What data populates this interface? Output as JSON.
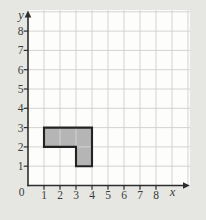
{
  "figure": {
    "background": "#e6e7e2",
    "plot_background": "#fdfdfc",
    "grid_color": "#d3d3d0",
    "axis_color": "#2d2d2d",
    "text_color": "#3b3b3b"
  },
  "chart_data": {
    "type": "polygon",
    "title": "",
    "xlabel": "x",
    "ylabel": "y",
    "origin_label": "0",
    "xlim": [
      0,
      9
    ],
    "ylim": [
      0,
      9
    ],
    "x_ticks": [
      "1",
      "2",
      "3",
      "4",
      "5",
      "6",
      "7",
      "8"
    ],
    "y_ticks": [
      "1",
      "2",
      "3",
      "4",
      "5",
      "6",
      "7",
      "8"
    ],
    "grid": true,
    "series": [
      {
        "name": "shaded-region",
        "type": "polygon",
        "vertices": [
          [
            1,
            2
          ],
          [
            1,
            3
          ],
          [
            4,
            3
          ],
          [
            4,
            1
          ],
          [
            3,
            1
          ],
          [
            3,
            2
          ]
        ],
        "fill": "#b5b5b5",
        "stroke": "#222222"
      }
    ]
  }
}
